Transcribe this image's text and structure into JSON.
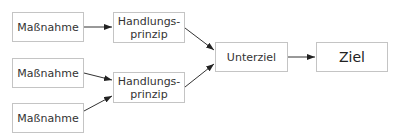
{
  "diagram": {
    "nodes": [
      {
        "id": "m1",
        "label": "Maßnahme",
        "x": 12,
        "y": 12,
        "w": 72,
        "h": 30
      },
      {
        "id": "m2",
        "label": "Maßnahme",
        "x": 12,
        "y": 58,
        "w": 72,
        "h": 30
      },
      {
        "id": "m3",
        "label": "Maßnahme",
        "x": 12,
        "y": 103,
        "w": 72,
        "h": 30
      },
      {
        "id": "h1",
        "label_line1": "Handlungs-",
        "label_line2": "prinzip",
        "x": 113,
        "y": 12,
        "w": 72,
        "h": 31
      },
      {
        "id": "h2",
        "label_line1": "Handlungs-",
        "label_line2": "prinzip",
        "x": 113,
        "y": 72,
        "w": 72,
        "h": 31
      },
      {
        "id": "u",
        "label": "Unterziel",
        "x": 215,
        "y": 42,
        "w": 73,
        "h": 30
      },
      {
        "id": "z",
        "label": "Ziel",
        "x": 316,
        "y": 42,
        "w": 72,
        "h": 30
      }
    ],
    "edges": [
      {
        "from": "m1",
        "to": "h1"
      },
      {
        "from": "m2",
        "to": "h2"
      },
      {
        "from": "m3",
        "to": "h2"
      },
      {
        "from": "h1",
        "to": "u"
      },
      {
        "from": "h2",
        "to": "u"
      },
      {
        "from": "u",
        "to": "z"
      }
    ],
    "colors": {
      "border": "#c4c4c4",
      "arrow": "#333333",
      "text": "#333333"
    }
  }
}
